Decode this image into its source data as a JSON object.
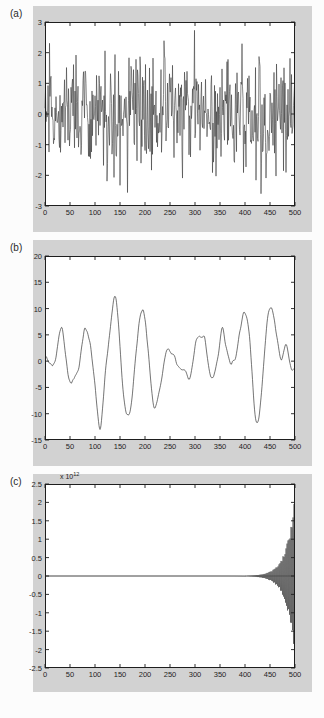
{
  "figure": {
    "background_color": "#fcfcfc",
    "panel_background_color": "#d2d2d2",
    "plot_background_color": "#ffffff",
    "line_color": "#3a3a3a",
    "axis_color": "#1e1e1e"
  },
  "panels": [
    {
      "label": "(a)",
      "exponent_label": "",
      "x": {
        "ticks": [
          0,
          50,
          100,
          150,
          200,
          250,
          300,
          350,
          400,
          450,
          500
        ],
        "tick_labels": [
          "0",
          "50",
          "100",
          "150",
          "200",
          "250",
          "300",
          "350",
          "400",
          "450",
          "500"
        ],
        "min": 0,
        "max": 500
      },
      "y": {
        "ticks": [
          -3,
          -2,
          -1,
          0,
          1,
          2,
          3
        ],
        "tick_labels": [
          "-3",
          "-2",
          "-1",
          "0",
          "1",
          "2",
          "3"
        ],
        "min": -3,
        "max": 3
      }
    },
    {
      "label": "(b)",
      "exponent_label": "",
      "x": {
        "ticks": [
          0,
          50,
          100,
          150,
          200,
          250,
          300,
          350,
          400,
          450,
          500
        ],
        "tick_labels": [
          "0",
          "50",
          "100",
          "150",
          "200",
          "250",
          "300",
          "350",
          "400",
          "450",
          "500"
        ],
        "min": 0,
        "max": 500
      },
      "y": {
        "ticks": [
          -15,
          -10,
          -5,
          0,
          5,
          10,
          15,
          20
        ],
        "tick_labels": [
          "-15",
          "-10",
          "-5",
          "0",
          "5",
          "10",
          "15",
          "20"
        ],
        "min": -15,
        "max": 20
      }
    },
    {
      "label": "(c)",
      "exponent_label": "x 10",
      "exponent_power": "12",
      "x": {
        "ticks": [
          0,
          50,
          100,
          150,
          200,
          250,
          300,
          350,
          400,
          450,
          500
        ],
        "tick_labels": [
          "0",
          "50",
          "100",
          "150",
          "200",
          "250",
          "300",
          "350",
          "400",
          "450",
          "500"
        ],
        "min": 0,
        "max": 500
      },
      "y": {
        "ticks": [
          -2.5,
          -2,
          -1.5,
          -1,
          -0.5,
          0,
          0.5,
          1,
          1.5,
          2,
          2.5
        ],
        "tick_labels": [
          "-2.5",
          "-2",
          "-1.5",
          "-1",
          "-0.5",
          "0",
          "0.5",
          "1",
          "1.5",
          "2",
          "2.5"
        ],
        "min": -2.5,
        "max": 2.5
      }
    }
  ],
  "chart_data": [
    {
      "type": "line",
      "panel": "(a)",
      "title": "",
      "xlabel": "",
      "ylabel": "",
      "xlim": [
        0,
        500
      ],
      "ylim": [
        -3,
        3
      ],
      "grid": false,
      "legend": "none",
      "description": "White Gaussian noise sequence, 500 samples, zero mean, unit variance. Values oscillate rapidly between roughly -2.7 and 2.6 with no visible trend.",
      "n_points": 500,
      "series": [
        {
          "name": "white noise",
          "stat_summary": {
            "mean": 0.0,
            "std": 1.0,
            "min": -2.7,
            "max": 2.6
          }
        }
      ]
    },
    {
      "type": "line",
      "panel": "(b)",
      "title": "",
      "xlabel": "",
      "ylabel": "",
      "xlim": [
        0,
        500
      ],
      "ylim": [
        -15,
        20
      ],
      "grid": false,
      "legend": "none",
      "description": "Smoothed / low-pass filtered random process, 500 samples. Slow quasi-periodic excursions with peaks near n=40 (13), n=200 (10), n=245 (12), n=315 (11), n=425 (16) and troughs near n=130 (-11), n=275 (-12), n=490 (-14).",
      "n_points": 500,
      "series": [
        {
          "name": "filtered process",
          "stat_summary": {
            "min": -14,
            "max": 16
          }
        }
      ]
    },
    {
      "type": "line",
      "panel": "(c)",
      "title": "",
      "xlabel": "",
      "ylabel": "",
      "xlim": [
        0,
        500
      ],
      "ylim": [
        -2500000000000.0,
        2500000000000.0
      ],
      "y_exponent": 12,
      "grid": false,
      "legend": "none",
      "description": "Unstable / divergent output: rapidly alternating sign oscillation whose envelope grows exponentially. Essentially zero until about n=400, then the envelope expands to roughly +/-2.1e12 by n=500.",
      "n_points": 500,
      "series": [
        {
          "name": "divergent oscillation",
          "envelope_onset": 400,
          "envelope_max": 2100000000000.0
        }
      ]
    }
  ]
}
